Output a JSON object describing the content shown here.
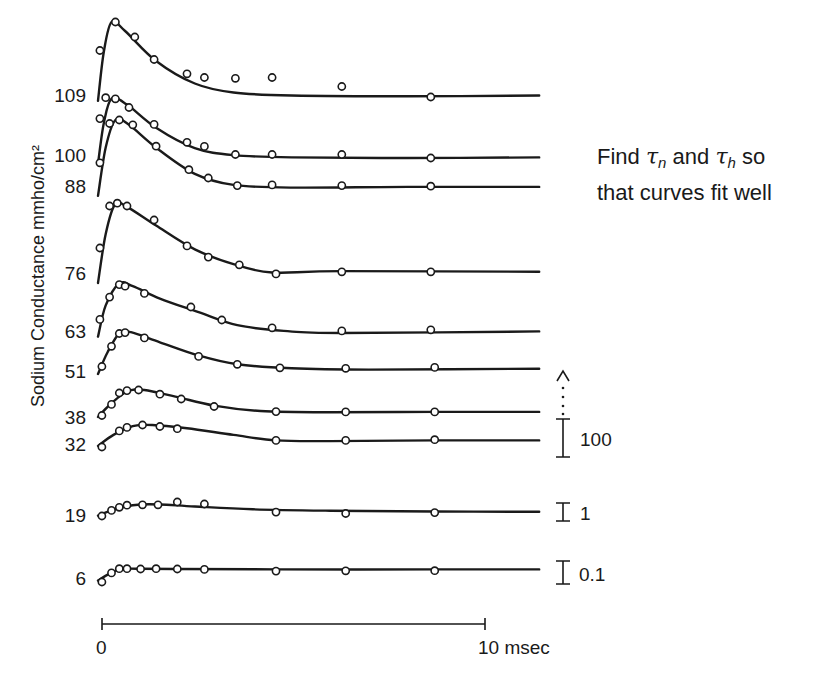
{
  "chart_data": {
    "type": "line",
    "title": "",
    "ylabel": "Sodium Conductance mmho/cm²",
    "xlabel": "msec",
    "x_scale_bar": {
      "start_label": "0",
      "end_label": "10 msec",
      "from": 0,
      "to": 10
    },
    "xlim": [
      0,
      11.4
    ],
    "annotation": {
      "line1_prefix": "Find ",
      "tau": "τ",
      "sub_n": "n",
      "middle": " and ",
      "sub_h": "h",
      "line1_suffix": " so",
      "line2": "that curves fit well"
    },
    "scale_bars": [
      {
        "label": "100",
        "applies_to": "upper traces (32–109 mV)",
        "arrow": "dotted-up"
      },
      {
        "label": "1",
        "applies_to": "19 mV trace"
      },
      {
        "label": "0.1",
        "applies_to": "6 mV trace"
      }
    ],
    "series_note": "y values are relative conductance in units of each trace's own scale; traces are vertically offset",
    "series": [
      {
        "name": "109",
        "t": [
          0.05,
          0.45,
          0.95,
          1.45,
          2.3,
          2.75,
          3.55,
          4.5,
          6.3,
          8.6
        ],
        "y": [
          0.62,
          1.0,
          0.8,
          0.5,
          0.31,
          0.26,
          0.25,
          0.26,
          0.14,
          0.0
        ],
        "fit": [
          [
            0,
            -0.05
          ],
          [
            0.15,
            0.6
          ],
          [
            0.35,
            1.0
          ],
          [
            0.7,
            0.88
          ],
          [
            1.5,
            0.48
          ],
          [
            2.5,
            0.18
          ],
          [
            3.5,
            0.06
          ],
          [
            5,
            0.02
          ],
          [
            8,
            0.01
          ],
          [
            11.4,
            0.02
          ]
        ]
      },
      {
        "name": "100",
        "t": [
          0.05,
          0.2,
          0.45,
          0.8,
          1.45,
          2.3,
          2.75,
          3.55,
          4.5,
          6.3,
          8.6
        ],
        "y": [
          0.68,
          1.04,
          1.02,
          0.87,
          0.58,
          0.27,
          0.2,
          0.06,
          0.06,
          0.06,
          0.0
        ],
        "fit": [
          [
            0,
            -0.1
          ],
          [
            0.15,
            0.6
          ],
          [
            0.35,
            1.02
          ],
          [
            0.75,
            0.92
          ],
          [
            1.5,
            0.52
          ],
          [
            2.5,
            0.17
          ],
          [
            3.5,
            0.05
          ],
          [
            5,
            0.01
          ],
          [
            8,
            0.0
          ],
          [
            11.4,
            0.01
          ]
        ]
      },
      {
        "name": "88",
        "t": [
          0.05,
          0.3,
          0.55,
          0.9,
          1.5,
          2.35,
          2.85,
          3.6,
          4.5,
          6.3,
          8.6
        ],
        "y": [
          0.38,
          0.95,
          1.0,
          0.93,
          0.62,
          0.28,
          0.16,
          0.05,
          0.06,
          0.05,
          0.04
        ],
        "fit": [
          [
            0,
            -0.1
          ],
          [
            0.2,
            0.6
          ],
          [
            0.45,
            1.0
          ],
          [
            0.8,
            0.93
          ],
          [
            1.5,
            0.6
          ],
          [
            2.5,
            0.22
          ],
          [
            3.5,
            0.06
          ],
          [
            5,
            0.02
          ],
          [
            8,
            0.03
          ],
          [
            11.4,
            0.03
          ]
        ]
      },
      {
        "name": "76",
        "t": [
          0.05,
          0.3,
          0.5,
          0.75,
          1.45,
          2.3,
          2.85,
          3.65,
          4.6,
          6.3,
          8.6
        ],
        "y": [
          0.4,
          1.0,
          1.04,
          1.0,
          0.8,
          0.43,
          0.27,
          0.16,
          0.03,
          0.06,
          0.06
        ],
        "fit": [
          [
            0,
            -0.1
          ],
          [
            0.2,
            0.6
          ],
          [
            0.45,
            1.03
          ],
          [
            0.8,
            0.97
          ],
          [
            1.5,
            0.72
          ],
          [
            2.5,
            0.38
          ],
          [
            3.5,
            0.17
          ],
          [
            4.5,
            0.05
          ],
          [
            6.3,
            0.07
          ],
          [
            11.4,
            0.06
          ]
        ]
      },
      {
        "name": "63",
        "t": [
          0.05,
          0.3,
          0.55,
          0.7,
          1.2,
          2.4,
          3.2,
          4.5,
          6.3,
          8.6
        ],
        "y": [
          0.28,
          0.71,
          0.95,
          0.92,
          0.78,
          0.52,
          0.27,
          0.12,
          0.06,
          0.08
        ],
        "fit": [
          [
            0,
            -0.05
          ],
          [
            0.2,
            0.55
          ],
          [
            0.55,
            0.97
          ],
          [
            0.9,
            0.92
          ],
          [
            1.6,
            0.68
          ],
          [
            2.6,
            0.42
          ],
          [
            3.6,
            0.17
          ],
          [
            4.8,
            0.06
          ],
          [
            6.3,
            0.02
          ],
          [
            11.4,
            0.05
          ]
        ]
      },
      {
        "name": "51",
        "t": [
          0.1,
          0.35,
          0.55,
          0.7,
          1.2,
          2.6,
          3.6,
          4.7,
          6.4,
          8.7
        ],
        "y": [
          0.17,
          0.63,
          0.92,
          0.94,
          0.82,
          0.4,
          0.22,
          0.14,
          0.13,
          0.15
        ],
        "fit": [
          [
            0,
            0.0
          ],
          [
            0.25,
            0.5
          ],
          [
            0.55,
            0.92
          ],
          [
            0.85,
            0.95
          ],
          [
            1.6,
            0.72
          ],
          [
            2.6,
            0.42
          ],
          [
            3.6,
            0.22
          ],
          [
            5,
            0.13
          ],
          [
            7,
            0.1
          ],
          [
            11.4,
            0.12
          ]
        ]
      },
      {
        "name": "38",
        "t": [
          0.1,
          0.35,
          0.55,
          0.75,
          1.05,
          1.6,
          2.15,
          3.0,
          4.6,
          6.4,
          8.7
        ],
        "y": [
          0.15,
          0.52,
          0.9,
          0.98,
          1.0,
          0.86,
          0.7,
          0.45,
          0.28,
          0.27,
          0.27
        ],
        "fit": [
          [
            0,
            0.1
          ],
          [
            0.3,
            0.5
          ],
          [
            0.75,
            0.95
          ],
          [
            1.2,
            1.0
          ],
          [
            2.0,
            0.78
          ],
          [
            3.0,
            0.48
          ],
          [
            4.2,
            0.3
          ],
          [
            6,
            0.26
          ],
          [
            8.7,
            0.27
          ],
          [
            11.4,
            0.27
          ]
        ]
      },
      {
        "name": "32",
        "t": [
          0.1,
          0.55,
          0.75,
          1.15,
          1.6,
          2.05,
          4.6,
          6.4,
          8.7
        ],
        "y": [
          0.0,
          0.73,
          0.89,
          1.0,
          0.93,
          0.83,
          0.3,
          0.3,
          0.33
        ],
        "fit": [
          [
            0,
            0.05
          ],
          [
            0.4,
            0.55
          ],
          [
            0.9,
            0.95
          ],
          [
            1.4,
            1.0
          ],
          [
            2.3,
            0.85
          ],
          [
            3.5,
            0.55
          ],
          [
            4.6,
            0.3
          ],
          [
            6,
            0.27
          ],
          [
            8.7,
            0.3
          ],
          [
            11.4,
            0.3
          ]
        ]
      },
      {
        "name": "19",
        "t": [
          0.1,
          0.35,
          0.55,
          0.75,
          1.15,
          1.55,
          2.05,
          2.75,
          4.6,
          6.4,
          8.7
        ],
        "y": [
          0.0,
          0.4,
          0.62,
          0.77,
          0.8,
          0.8,
          1.0,
          0.86,
          0.28,
          0.18,
          0.24
        ],
        "fit": [
          [
            0,
            0.02
          ],
          [
            0.3,
            0.35
          ],
          [
            0.7,
            0.68
          ],
          [
            1.1,
            0.82
          ],
          [
            1.6,
            0.82
          ],
          [
            2.5,
            0.68
          ],
          [
            4,
            0.48
          ],
          [
            6,
            0.38
          ],
          [
            8.7,
            0.32
          ],
          [
            11.4,
            0.3
          ]
        ]
      },
      {
        "name": "6",
        "t": [
          0.1,
          0.35,
          0.55,
          0.75,
          1.1,
          1.5,
          2.05,
          2.75,
          4.6,
          6.4,
          8.7
        ],
        "y": [
          0.0,
          0.65,
          0.95,
          0.95,
          0.93,
          0.95,
          0.93,
          0.9,
          0.78,
          0.8,
          0.81
        ],
        "fit": [
          [
            0,
            0.1
          ],
          [
            0.3,
            0.6
          ],
          [
            0.6,
            0.92
          ],
          [
            1.0,
            0.95
          ],
          [
            2.0,
            0.93
          ],
          [
            4.6,
            0.9
          ],
          [
            8.7,
            0.9
          ],
          [
            11.4,
            0.9
          ]
        ]
      }
    ]
  }
}
